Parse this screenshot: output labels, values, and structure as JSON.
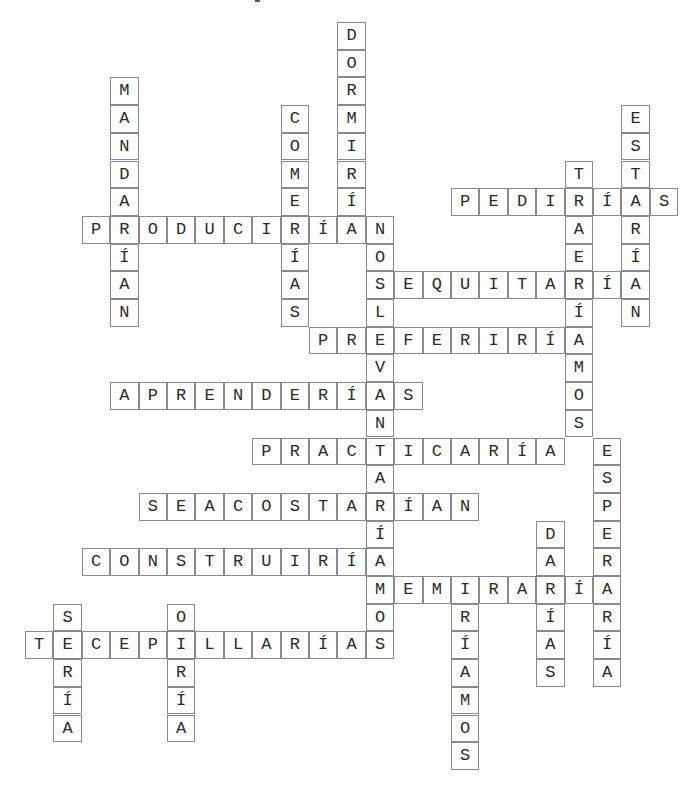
{
  "grid": {
    "origin_x": 25,
    "origin_y": 22,
    "cell_w": 28.4,
    "cell_h": 27.7,
    "colors": {
      "border": "#8a8a8a",
      "letter": "#2a2a2a",
      "background": "#ffffff"
    },
    "words": [
      {
        "answer": "DORMIRÍA",
        "row": 0,
        "col": 11,
        "dir": "down"
      },
      {
        "answer": "MANDARÍAN",
        "row": 2,
        "col": 3,
        "dir": "down"
      },
      {
        "answer": "COMERÍAS",
        "row": 3,
        "col": 9,
        "dir": "down"
      },
      {
        "answer": "ESTARÍAN",
        "row": 3,
        "col": 21,
        "dir": "down"
      },
      {
        "answer": "TRAERÍAMOS",
        "row": 5,
        "col": 19,
        "dir": "down"
      },
      {
        "answer": "PEDIRÍAS",
        "row": 6,
        "col": 15,
        "dir": "across"
      },
      {
        "answer": "PRODUCIRÍAN",
        "row": 7,
        "col": 2,
        "dir": "across"
      },
      {
        "answer": "NOSLEVANTARÍAMOS",
        "row": 7,
        "col": 12,
        "dir": "down"
      },
      {
        "answer": "SEQUITARÍA",
        "row": 9,
        "col": 12,
        "dir": "across"
      },
      {
        "answer": "PREFERIRÍA",
        "row": 11,
        "col": 10,
        "dir": "across"
      },
      {
        "answer": "APRENDERÍAS",
        "row": 13,
        "col": 3,
        "dir": "across"
      },
      {
        "answer": "PRACTICARÍA",
        "row": 15,
        "col": 8,
        "dir": "across"
      },
      {
        "answer": "ESPERARÍA",
        "row": 15,
        "col": 20,
        "dir": "down"
      },
      {
        "answer": "SEACOSTARÍAN",
        "row": 17,
        "col": 4,
        "dir": "across"
      },
      {
        "answer": "DARÍAS",
        "row": 18,
        "col": 18,
        "dir": "down"
      },
      {
        "answer": "CONSTRUIRÍA",
        "row": 19,
        "col": 2,
        "dir": "across"
      },
      {
        "answer": "MEMIRARÍA",
        "row": 20,
        "col": 12,
        "dir": "across"
      },
      {
        "answer": "IRÍAMOS",
        "row": 20,
        "col": 15,
        "dir": "down"
      },
      {
        "answer": "SERÍA",
        "row": 21,
        "col": 1,
        "dir": "down"
      },
      {
        "answer": "OIRÍA",
        "row": 21,
        "col": 5,
        "dir": "down"
      },
      {
        "answer": "TECEPILLARÍAS",
        "row": 22,
        "col": 0,
        "dir": "across"
      }
    ]
  }
}
